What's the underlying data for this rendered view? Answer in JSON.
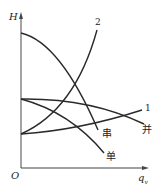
{
  "diagram": {
    "type": "pump-pipeline characteristic curves",
    "axes": {
      "y_label": "H",
      "x_label": "q",
      "x_label_subscript": "v",
      "origin_label": "O"
    },
    "curves": [
      {
        "id": "series",
        "label": "串",
        "kind": "pump curve (series)"
      },
      {
        "id": "parallel",
        "label": "并",
        "kind": "pump curve (parallel)"
      },
      {
        "id": "single",
        "label": "单",
        "kind": "pump curve (single)"
      },
      {
        "id": "pipe1",
        "label": "1",
        "kind": "pipeline curve"
      },
      {
        "id": "pipe2",
        "label": "2",
        "kind": "pipeline curve"
      }
    ],
    "colors": {
      "line": "#2a2a2a",
      "axis": "#555555"
    }
  }
}
